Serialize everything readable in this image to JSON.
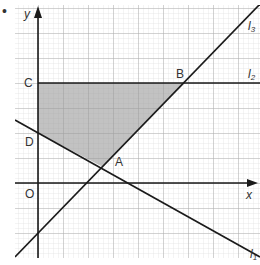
{
  "figure": {
    "bullet": "•",
    "axes": {
      "x_label": "x",
      "y_label": "y",
      "origin_label": "O"
    },
    "points": [
      {
        "name": "A",
        "px": [
          103,
          167
        ]
      },
      {
        "name": "B",
        "px": [
          185,
          83
        ]
      },
      {
        "name": "C",
        "px": [
          38,
          83
        ]
      },
      {
        "name": "D",
        "px": [
          38,
          133
        ]
      }
    ],
    "lines": [
      {
        "name": "l",
        "sub": "1",
        "description": "line through D and A, negative slope"
      },
      {
        "name": "l",
        "sub": "2",
        "description": "horizontal line through C and B"
      },
      {
        "name": "l",
        "sub": "3",
        "description": "line through A and B, positive slope"
      }
    ],
    "shaded_region": {
      "vertices": [
        "C",
        "B",
        "A",
        "D"
      ],
      "fill": "#b8b8b8"
    },
    "colors": {
      "grid_minor": "#d9d9d9",
      "grid_major": "#a8a8a8",
      "line": "#1a1a1a",
      "shade": "#b8b8b8"
    }
  }
}
